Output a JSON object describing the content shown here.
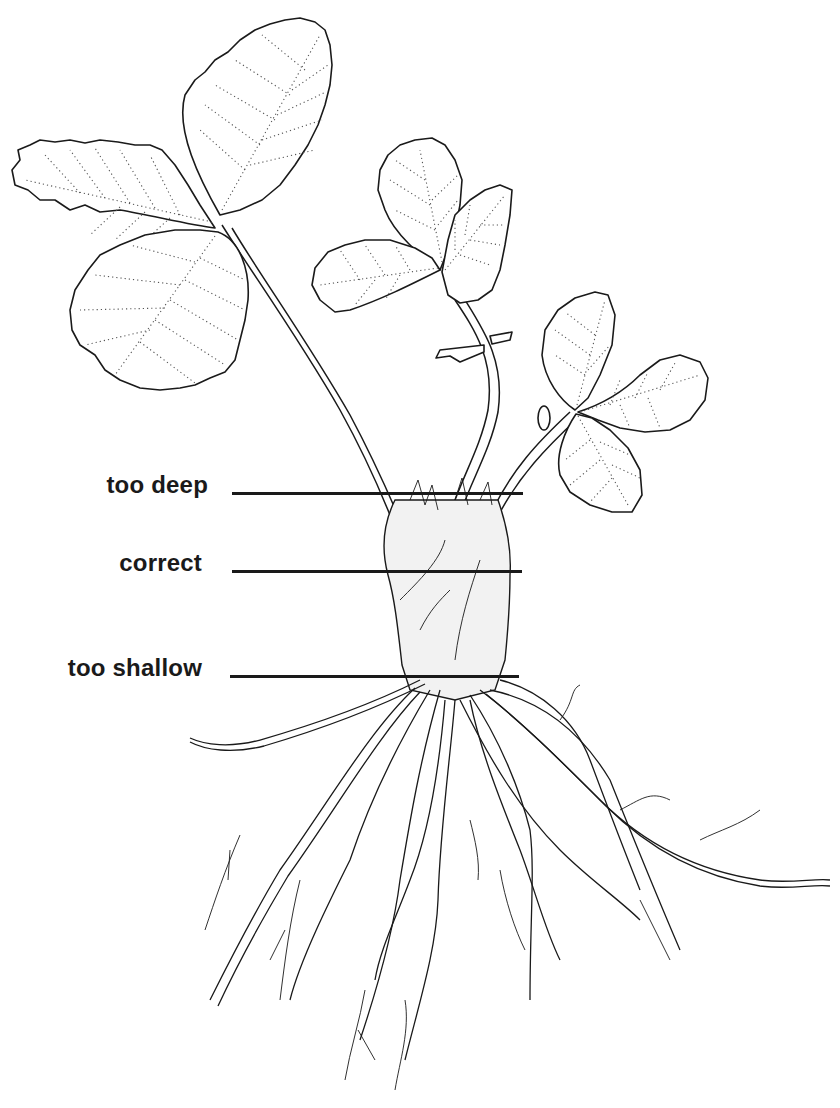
{
  "diagram": {
    "colors": {
      "ink": "#1a1a1a",
      "background": "#ffffff"
    },
    "depth_markers": [
      {
        "id": "too-deep",
        "label": "too deep",
        "line_y": 493,
        "line_x1": 232,
        "line_x2": 523
      },
      {
        "id": "correct",
        "label": "correct",
        "line_y": 571,
        "line_x1": 232,
        "line_x2": 522
      },
      {
        "id": "too-shallow",
        "label": "too shallow",
        "line_y": 676,
        "line_x1": 230,
        "line_x2": 519
      }
    ]
  }
}
